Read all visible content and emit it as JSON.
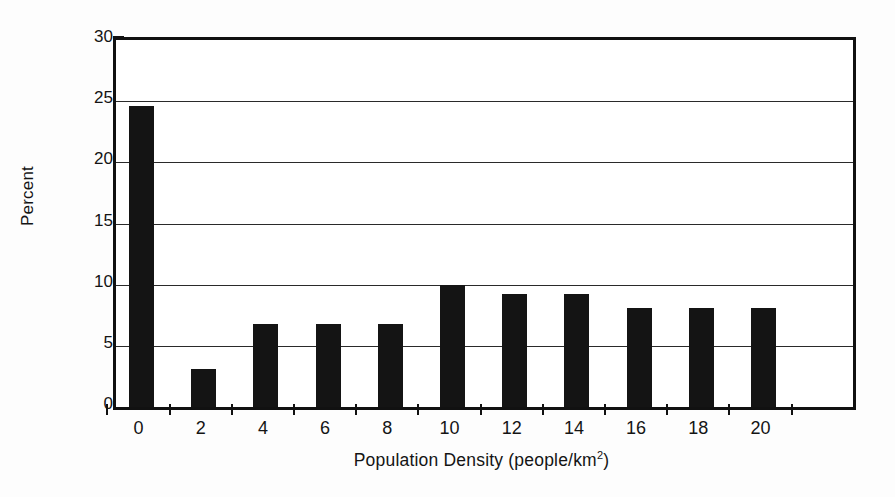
{
  "chart_data": {
    "type": "bar",
    "title": "",
    "subtitle": "",
    "xlabel": "Population Density (people/km",
    "xlabel_superscript": "2",
    "xlabel_suffix": ")",
    "ylabel": "Percent",
    "categories": [
      0,
      2,
      4,
      6,
      8,
      10,
      12,
      14,
      16,
      18,
      20
    ],
    "xtick_labels": [
      "0",
      "2",
      "4",
      "6",
      "8",
      "10",
      "12",
      "14",
      "16",
      "18",
      "20"
    ],
    "values": [
      24.6,
      3.1,
      6.8,
      6.8,
      6.8,
      10.0,
      9.2,
      9.2,
      8.1,
      8.1,
      8.1
    ],
    "ytick_labels": [
      "0",
      "5",
      "10",
      "15",
      "20",
      "25",
      "30"
    ],
    "yticks": [
      0,
      5,
      10,
      15,
      20,
      25,
      30
    ],
    "ylim": [
      0,
      30
    ],
    "xlim": [
      -1,
      21
    ],
    "grid": true,
    "grid_axis": "y",
    "legend": false,
    "legend_position": "none",
    "bar_color": "#141414",
    "axis_color": "#111111",
    "grid_color": "#2a2a2a",
    "background_color": "#ffffff"
  }
}
